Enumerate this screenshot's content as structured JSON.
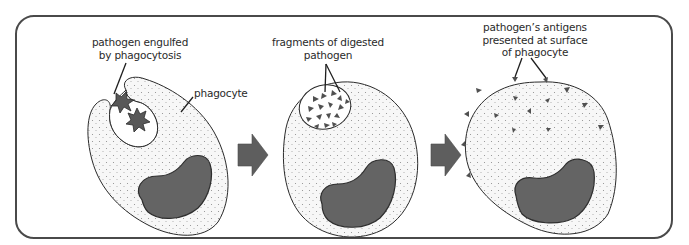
{
  "diagram": {
    "title": "",
    "stages": [
      {
        "id": "engulfment",
        "labels": [
          {
            "text_line1": "pathogen engulfed",
            "text_line2": "by phagocytosis"
          },
          {
            "text_line1": "phagocyte"
          }
        ]
      },
      {
        "id": "digestion",
        "labels": [
          {
            "text_line1": "fragments of digested",
            "text_line2": "pathogen"
          }
        ]
      },
      {
        "id": "presentation",
        "labels": [
          {
            "text_line1": "pathogen’s antigens",
            "text_line2": "presented at surface",
            "text_line3": "of phagocyte"
          }
        ]
      }
    ],
    "arrows": [
      {
        "from": "engulfment",
        "to": "digestion",
        "icon": "right-block-arrow-icon"
      },
      {
        "from": "digestion",
        "to": "presentation",
        "icon": "right-block-arrow-icon"
      }
    ],
    "colors": {
      "frame": "#4a4a4a",
      "cytoplasm_stipple": "#d9d9d9",
      "nucleus": "#646464",
      "pathogen": "#585858",
      "arrow": "#5e5e5e",
      "text": "#2a2a2a"
    }
  }
}
